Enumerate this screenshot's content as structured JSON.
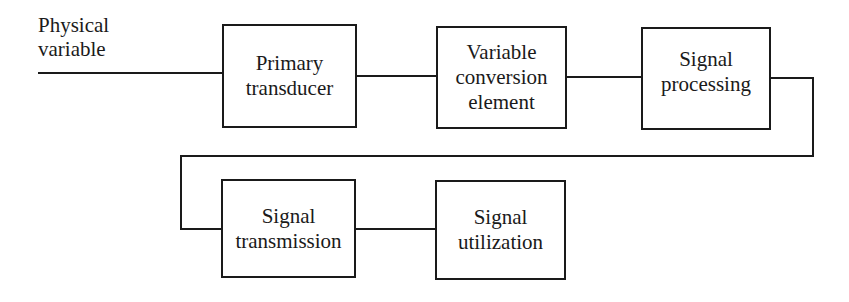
{
  "diagram": {
    "input_label": [
      "Physical",
      "variable"
    ],
    "blocks": [
      {
        "id": "primary-transducer",
        "lines": [
          "Primary",
          "transducer"
        ]
      },
      {
        "id": "variable-conversion-element",
        "lines": [
          "Variable",
          "conversion",
          "element"
        ]
      },
      {
        "id": "signal-processing",
        "lines": [
          "Signal",
          "processing"
        ]
      },
      {
        "id": "signal-transmission",
        "lines": [
          "Signal",
          "transmission"
        ]
      },
      {
        "id": "signal-utilization",
        "lines": [
          "Signal",
          "utilization"
        ]
      }
    ],
    "connections": [
      [
        "input",
        "primary-transducer"
      ],
      [
        "primary-transducer",
        "variable-conversion-element"
      ],
      [
        "variable-conversion-element",
        "signal-processing"
      ],
      [
        "signal-processing",
        "signal-transmission"
      ],
      [
        "signal-transmission",
        "signal-utilization"
      ]
    ],
    "colors": {
      "stroke": "#1a1a1a",
      "background": "#ffffff"
    }
  }
}
